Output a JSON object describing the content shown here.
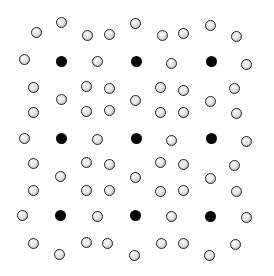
{
  "diagram": {
    "type": "crystal-lattice",
    "colors": {
      "solid_atom": "#050505",
      "open_atom_outline": "#222222",
      "background": "#ffffff"
    },
    "solid_atoms": [
      [
        61,
        61
      ],
      [
        136,
        61
      ],
      [
        211,
        61
      ],
      [
        61,
        138
      ],
      [
        136,
        138
      ],
      [
        211,
        138
      ],
      [
        60,
        215
      ],
      [
        135,
        215
      ],
      [
        210,
        216
      ]
    ],
    "open_atoms": [
      [
        36,
        32
      ],
      [
        61,
        22
      ],
      [
        87,
        35
      ],
      [
        109,
        34
      ],
      [
        135,
        23
      ],
      [
        162,
        35
      ],
      [
        183,
        33
      ],
      [
        210,
        25
      ],
      [
        236,
        36
      ],
      [
        24,
        59
      ],
      [
        97,
        61
      ],
      [
        171,
        63
      ],
      [
        246,
        64
      ],
      [
        33,
        87
      ],
      [
        86,
        86
      ],
      [
        109,
        88
      ],
      [
        160,
        87
      ],
      [
        183,
        90
      ],
      [
        234,
        88
      ],
      [
        61,
        99
      ],
      [
        135,
        100
      ],
      [
        210,
        101
      ],
      [
        33,
        112
      ],
      [
        86,
        111
      ],
      [
        109,
        110
      ],
      [
        160,
        112
      ],
      [
        183,
        112
      ],
      [
        236,
        113
      ],
      [
        24,
        138
      ],
      [
        97,
        139
      ],
      [
        171,
        140
      ],
      [
        246,
        141
      ],
      [
        33,
        163
      ],
      [
        86,
        162
      ],
      [
        109,
        164
      ],
      [
        160,
        162
      ],
      [
        183,
        164
      ],
      [
        234,
        165
      ],
      [
        60,
        176
      ],
      [
        135,
        177
      ],
      [
        210,
        178
      ],
      [
        33,
        190
      ],
      [
        86,
        190
      ],
      [
        109,
        190
      ],
      [
        160,
        191
      ],
      [
        183,
        190
      ],
      [
        236,
        191
      ],
      [
        22,
        215
      ],
      [
        97,
        216
      ],
      [
        171,
        216
      ],
      [
        246,
        217
      ],
      [
        33,
        243
      ],
      [
        86,
        242
      ],
      [
        107,
        243
      ],
      [
        161,
        243
      ],
      [
        183,
        243
      ],
      [
        235,
        244
      ],
      [
        59,
        254
      ],
      [
        134,
        255
      ],
      [
        209,
        255
      ]
    ]
  }
}
